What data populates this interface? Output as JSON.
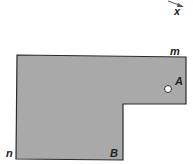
{
  "diagram": {
    "axis_label": "x",
    "corner_labels": {
      "top_right": "m",
      "bottom_left": "n"
    },
    "points": {
      "A": "A",
      "B": "B"
    },
    "colors": {
      "plate_fill": "#a9a9a9",
      "outline": "#2b2b2b",
      "hole": "#ffffff"
    }
  }
}
